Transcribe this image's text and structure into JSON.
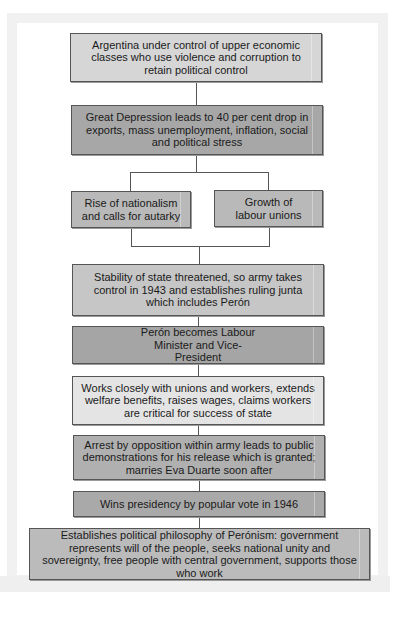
{
  "diagram": {
    "type": "flowchart",
    "colors": {
      "light": "#d6d6d6",
      "dark": "#a7a7a7",
      "medium": "#b9b9b9",
      "very_light": "#e4e4e4",
      "border": "#555555"
    },
    "nodes": [
      {
        "id": "n1",
        "text": "Argentina under control of upper economic classes who use violence and corruption to retain political control"
      },
      {
        "id": "n2",
        "text": "Great Depression leads to 40 per cent drop in exports, mass unemployment, inflation, social and political stress"
      },
      {
        "id": "n3a",
        "text": "Rise of nationalism and calls for autarky"
      },
      {
        "id": "n3b",
        "text": "Growth of labour unions"
      },
      {
        "id": "n4",
        "text": "Stability of state threatened, so army takes control in 1943 and establishes ruling junta which includes Perón"
      },
      {
        "id": "n5",
        "text": "Perón becomes Labour Minister and Vice-President"
      },
      {
        "id": "n6",
        "text": "Works closely with unions and workers, extends welfare benefits, raises wages, claims workers are critical for success of state"
      },
      {
        "id": "n7",
        "text": "Arrest by opposition within army leads to public demonstrations for his release which is granted; marries Eva Duarte soon after"
      },
      {
        "id": "n8",
        "text": "Wins presidency by popular vote in 1946"
      },
      {
        "id": "n9",
        "text": "Establishes political philosophy of Perónism: government represents will of the people, seeks national unity and sovereignty, free people with central government, supports those who work"
      }
    ],
    "edges": [
      [
        "n1",
        "n2"
      ],
      [
        "n2",
        "n3a"
      ],
      [
        "n2",
        "n3b"
      ],
      [
        "n3a",
        "n4"
      ],
      [
        "n3b",
        "n4"
      ],
      [
        "n4",
        "n5"
      ],
      [
        "n5",
        "n6"
      ],
      [
        "n6",
        "n7"
      ],
      [
        "n7",
        "n8"
      ],
      [
        "n8",
        "n9"
      ]
    ]
  }
}
